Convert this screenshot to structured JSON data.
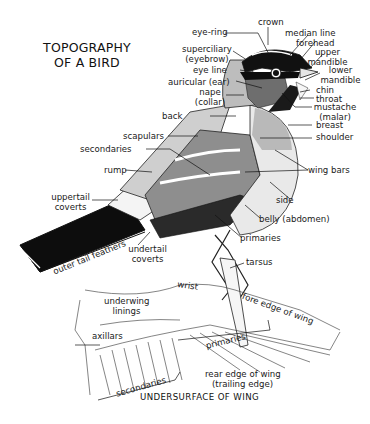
{
  "title": {
    "line1": "TOPOGRAPHY",
    "line2": "OF A BIRD"
  },
  "labels": {
    "crown": "crown",
    "eye_ring": "eye-ring",
    "median_line": "median line",
    "forehead": "forehead",
    "superciliary": "superciliary",
    "superciliary_alt": "(eyebrow)",
    "upper_mandible_1": "upper",
    "upper_mandible_2": "mandible",
    "eye_line": "eye line",
    "lower_mandible_1": "lower",
    "lower_mandible_2": "mandible",
    "auricular": "auricular (ear)",
    "nape": "nape",
    "nape_alt": "(collar)",
    "chin": "chin",
    "throat": "throat",
    "mustache": "mustache",
    "mustache_alt": "(malar)",
    "back": "back",
    "breast": "breast",
    "shoulder": "shoulder",
    "scapulars": "scapulars",
    "secondaries": "secondaries",
    "wing_bars": "wing bars",
    "rump": "rump",
    "side": "side",
    "uppertail_coverts_1": "uppertail",
    "uppertail_coverts_2": "coverts",
    "belly": "belly (abdomen)",
    "primaries": "primaries",
    "undertail_coverts_1": "undertail",
    "undertail_coverts_2": "coverts",
    "outer_tail_feathers": "outer tail feathers",
    "tarsus": "tarsus",
    "wrist": "wrist",
    "underwing_linings_1": "underwing",
    "underwing_linings_2": "linings",
    "fore_edge": "fore edge of wing",
    "axillars": "axillars",
    "wing_primaries": "primaries",
    "wing_secondaries": "secondaries",
    "rear_edge_1": "rear edge of wing",
    "rear_edge_2": "(trailing edge)"
  },
  "caption": "UNDERSURFACE OF WING",
  "colors": {
    "ink": "#1a1a1a",
    "dark_gray": "#6e6e6e",
    "mid_gray": "#a8a8a8",
    "light_gray": "#cfcfcf",
    "black": "#0d0d0d"
  }
}
